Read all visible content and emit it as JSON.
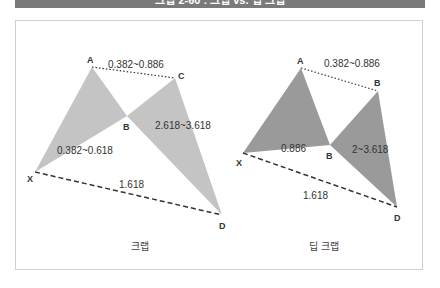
{
  "header": {
    "title": "크랩 2-60 : 크랩 vs. 딥 크랩"
  },
  "colors": {
    "header_bg": "#7a7a7a",
    "crab_fill": "#c4c4c4",
    "deep_crab_fill": "#9a9a9a",
    "line": "#333333",
    "frame_border": "#cfcfcf"
  },
  "diagrams": [
    {
      "caption": "크랩",
      "points": {
        "X": {
          "label": "X",
          "x": 35,
          "y": 172
        },
        "A": {
          "label": "A",
          "x": 92,
          "y": 67
        },
        "B": {
          "label": "B",
          "x": 127,
          "y": 116
        },
        "C": {
          "label": "C",
          "x": 175,
          "y": 78
        },
        "D": {
          "label": "D",
          "x": 222,
          "y": 215
        }
      },
      "ratios": {
        "AC": "0.382~0.886",
        "XB": "0.382~0.618",
        "BD": "2.618~3.618",
        "XD": "1.618"
      }
    },
    {
      "caption": "딥 크랩",
      "points": {
        "X": {
          "label": "X",
          "x": 243,
          "y": 153
        },
        "A": {
          "label": "A",
          "x": 301,
          "y": 68
        },
        "B": {
          "label": "B",
          "x": 330,
          "y": 145
        },
        "C": {
          "label": "B",
          "x": 378,
          "y": 91
        },
        "D": {
          "label": "D",
          "x": 397,
          "y": 207
        }
      },
      "ratios": {
        "AC": "0.382~0.886",
        "XB": "0.886",
        "BD": "2~3.618",
        "XD": "1.618"
      }
    }
  ]
}
